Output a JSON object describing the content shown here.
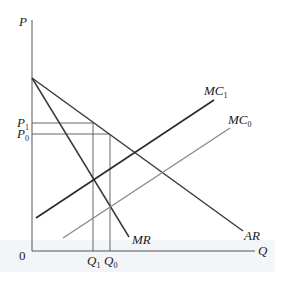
{
  "diagram": {
    "axes": {
      "y_label": "P",
      "x_label": "Q",
      "origin_label": "0"
    },
    "curves": [
      {
        "id": "AR",
        "label": "AR",
        "label_sub": "",
        "color": "#3a3a3a",
        "description": "Average revenue (demand) curve"
      },
      {
        "id": "MR",
        "label": "MR",
        "label_sub": "",
        "color": "#3a3a3a",
        "description": "Marginal revenue curve"
      },
      {
        "id": "MC1",
        "label": "MC",
        "label_sub": "1",
        "color": "#2a2a2a",
        "description": "New marginal cost curve"
      },
      {
        "id": "MC0",
        "label": "MC",
        "label_sub": "0",
        "color": "#8a8a8a",
        "description": "Original marginal cost curve"
      }
    ],
    "price_levels": [
      {
        "id": "P1",
        "label": "P",
        "label_sub": "1"
      },
      {
        "id": "P0",
        "label": "P",
        "label_sub": "0"
      }
    ],
    "quantity_levels": [
      {
        "id": "Q1",
        "label": "Q",
        "label_sub": "1"
      },
      {
        "id": "Q0",
        "label": "Q",
        "label_sub": "0"
      }
    ],
    "colors": {
      "axis": "#555555",
      "guide": "#555555",
      "band": "#f3f5f8"
    }
  }
}
